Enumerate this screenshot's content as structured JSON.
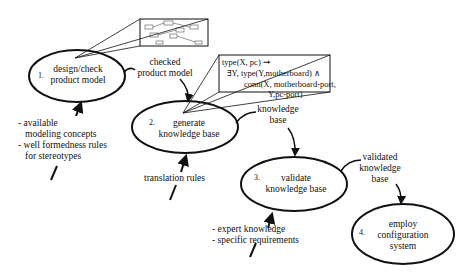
{
  "steps": [
    {
      "num": "1.",
      "line1": "design/check",
      "line2": "product model",
      "line3": ""
    },
    {
      "num": "2.",
      "line1": "generate",
      "line2": "knowledge base",
      "line3": ""
    },
    {
      "num": "3.",
      "line1": "validate",
      "line2": "knowledge base",
      "line3": ""
    },
    {
      "num": "4.",
      "line1": "employ",
      "line2": "configuration",
      "line3": "system"
    }
  ],
  "flows": {
    "checked_product_model": [
      "checked",
      "product model"
    ],
    "knowledge_base": [
      "knowledge",
      "base"
    ],
    "validated_knowledge_base": [
      "validated",
      "knowledge",
      "base"
    ]
  },
  "inputs": {
    "step1": [
      "- available",
      "modeling concepts",
      "- well formedness rules",
      "for stereotypes"
    ],
    "step2": [
      "translation rules"
    ],
    "step3": [
      "- expert knowledge",
      "- specific requirements"
    ]
  },
  "formula": {
    "line1": "type(X, pc) ➞",
    "line2": "∃Y, type(Y,motherboard)  ∧",
    "line3": "conn(X, motherboard-port,",
    "line4": "Y,pc-port)"
  },
  "colors": {
    "stroke": "#111111",
    "background": "#ffffff"
  }
}
